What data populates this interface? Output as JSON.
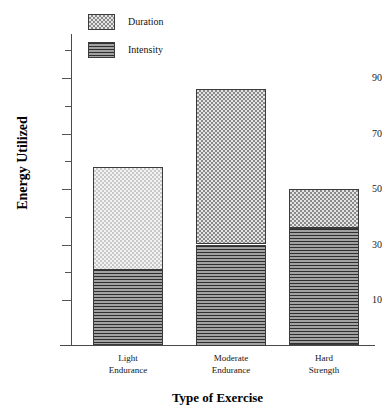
{
  "chart_data": {
    "type": "bar",
    "subtype": "stacked",
    "title": "",
    "xlabel": "Type of Exercise",
    "ylabel": "Energy Utilized",
    "categories": [
      "Light\nEndurance",
      "Moderate\nEndurance",
      "Hard\nStrength"
    ],
    "category_lines": [
      [
        "Light",
        "Endurance"
      ],
      [
        "Moderate",
        "Endurance"
      ],
      [
        "Hard",
        "Strength"
      ]
    ],
    "series": [
      {
        "name": "Intensity",
        "values": [
          21,
          30,
          36
        ]
      },
      {
        "name": "Duration",
        "values": [
          37,
          56,
          14
        ]
      }
    ],
    "totals": [
      58,
      86,
      50
    ],
    "ylim": [
      0,
      100
    ],
    "major_ticks": [
      10,
      30,
      50,
      70,
      90
    ],
    "minor_ticks": [
      20,
      40,
      60,
      80,
      100
    ],
    "ytick_labels": [
      "10",
      "30",
      "50",
      "70",
      "90"
    ],
    "grid": false,
    "legend_position": "top-left",
    "legend": [
      {
        "label": "Duration",
        "pattern": "checkerboard"
      },
      {
        "label": "Intensity",
        "pattern": "horizontal-lines"
      }
    ]
  },
  "axes": {
    "y_title": "Energy Utilized",
    "x_title": "Type of Exercise",
    "y_labels": [
      {
        "text": "90",
        "value": 90
      },
      {
        "text": "70",
        "value": 70
      },
      {
        "text": "50",
        "value": 50
      },
      {
        "text": "30",
        "value": 30
      },
      {
        "text": "10",
        "value": 10
      }
    ]
  },
  "legend": {
    "items": [
      {
        "label": "Duration"
      },
      {
        "label": "Intensity"
      }
    ]
  },
  "colors": {
    "axis": "#4a4a4a",
    "text": "#141414",
    "duration_light": "#f2f2f2",
    "duration_dark": "#e4e4e4",
    "intensity": "#6b6b6b",
    "outline": "#3b3b3b"
  }
}
